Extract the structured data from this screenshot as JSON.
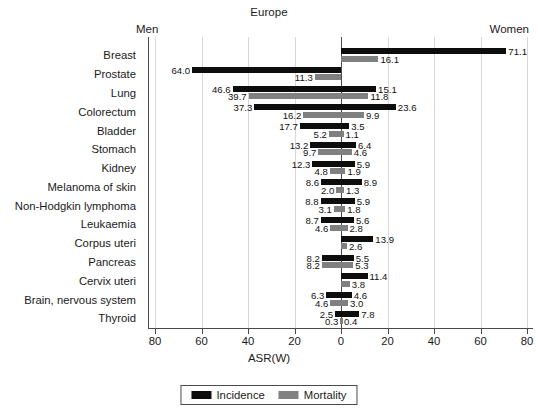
{
  "header": {
    "title": "Europe",
    "left_label": "Men",
    "right_label": "Women"
  },
  "axis": {
    "xlabel": "ASR(W)",
    "ticks": [
      "80",
      "60",
      "40",
      "20",
      "0",
      "20",
      "40",
      "60",
      "80"
    ],
    "tick_values": [
      -80,
      -60,
      -40,
      -20,
      0,
      20,
      40,
      60,
      80
    ],
    "xlim": [
      -85,
      85
    ]
  },
  "legend": {
    "position": "bottom-center",
    "items": [
      {
        "label": "Incidence",
        "color": "#0d0d0d"
      },
      {
        "label": "Mortality",
        "color": "#808080"
      }
    ]
  },
  "chart_data": {
    "type": "bar",
    "orientation": "horizontal",
    "style": "population-pyramid",
    "title": "Europe",
    "xlabel": "ASR(W)",
    "ylabel": "",
    "xlim": [
      -85,
      85
    ],
    "grid": true,
    "left_group": "Men",
    "right_group": "Women",
    "series": [
      {
        "name": "Incidence",
        "color": "#0d0d0d"
      },
      {
        "name": "Mortality",
        "color": "#808080"
      }
    ],
    "categories": [
      "Breast",
      "Prostate",
      "Lung",
      "Colorectum",
      "Bladder",
      "Stomach",
      "Kidney",
      "Melanoma of skin",
      "Non-Hodgkin lymphoma",
      "Leukaemia",
      "Corpus uteri",
      "Pancreas",
      "Cervix uteri",
      "Brain, nervous system",
      "Thyroid"
    ],
    "rows": [
      {
        "category": "Breast",
        "men_incidence": null,
        "men_mortality": null,
        "women_incidence": 71.1,
        "women_mortality": 16.1
      },
      {
        "category": "Prostate",
        "men_incidence": 64.0,
        "men_mortality": 11.3,
        "women_incidence": null,
        "women_mortality": null
      },
      {
        "category": "Lung",
        "men_incidence": 46.6,
        "men_mortality": 39.7,
        "women_incidence": 15.1,
        "women_mortality": 11.8
      },
      {
        "category": "Colorectum",
        "men_incidence": 37.3,
        "men_mortality": 16.2,
        "women_incidence": 23.6,
        "women_mortality": 9.9
      },
      {
        "category": "Bladder",
        "men_incidence": 17.7,
        "men_mortality": 5.2,
        "women_incidence": 3.5,
        "women_mortality": 1.1
      },
      {
        "category": "Stomach",
        "men_incidence": 13.2,
        "men_mortality": 9.7,
        "women_incidence": 6.4,
        "women_mortality": 4.6
      },
      {
        "category": "Kidney",
        "men_incidence": 12.3,
        "men_mortality": 4.8,
        "women_incidence": 5.9,
        "women_mortality": 1.9
      },
      {
        "category": "Melanoma of skin",
        "men_incidence": 8.6,
        "men_mortality": 2.0,
        "women_incidence": 8.9,
        "women_mortality": 1.3
      },
      {
        "category": "Non-Hodgkin lymphoma",
        "men_incidence": 8.8,
        "men_mortality": 3.1,
        "women_incidence": 5.9,
        "women_mortality": 1.8
      },
      {
        "category": "Leukaemia",
        "men_incidence": 8.7,
        "men_mortality": 4.6,
        "women_incidence": 5.6,
        "women_mortality": 2.8
      },
      {
        "category": "Corpus uteri",
        "men_incidence": null,
        "men_mortality": null,
        "women_incidence": 13.9,
        "women_mortality": 2.6
      },
      {
        "category": "Pancreas",
        "men_incidence": 8.2,
        "men_mortality": 8.2,
        "women_incidence": 5.5,
        "women_mortality": 5.3
      },
      {
        "category": "Cervix uteri",
        "men_incidence": null,
        "men_mortality": null,
        "women_incidence": 11.4,
        "women_mortality": 3.8
      },
      {
        "category": "Brain, nervous system",
        "men_incidence": 6.3,
        "men_mortality": 4.6,
        "women_incidence": 4.6,
        "women_mortality": 3.0
      },
      {
        "category": "Thyroid",
        "men_incidence": 2.5,
        "men_mortality": 0.3,
        "women_incidence": 7.8,
        "women_mortality": 0.4
      }
    ]
  }
}
